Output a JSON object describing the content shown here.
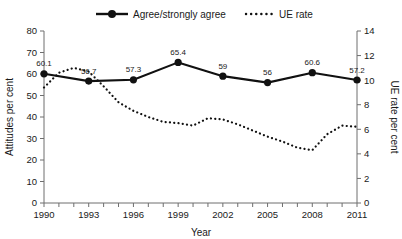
{
  "chart_data": {
    "type": "line",
    "title": "",
    "xlabel": "Year",
    "ylabel": "Attitudes per cent",
    "y2label": "UE rate per cent",
    "grid": false,
    "legend_position": "top",
    "xlim": [
      1990,
      2011
    ],
    "ylim": [
      0,
      80
    ],
    "y2lim": [
      0,
      14
    ],
    "ytick_labels": [
      "0",
      "10",
      "20",
      "30",
      "40",
      "50",
      "60",
      "70",
      "80"
    ],
    "yticks": [
      0,
      10,
      20,
      30,
      40,
      50,
      60,
      70,
      80
    ],
    "y2tick_labels": [
      "0",
      "2",
      "4",
      "6",
      "8",
      "10",
      "12",
      "14"
    ],
    "y2ticks": [
      0,
      2,
      4,
      6,
      8,
      10,
      12,
      14
    ],
    "xtick_labels": [
      "1990",
      "1993",
      "1996",
      "1999",
      "2002",
      "2005",
      "2008",
      "2011"
    ],
    "xticks": [
      1990,
      1993,
      1996,
      1999,
      2002,
      2005,
      2008,
      2011
    ],
    "x_minor_ticks": [
      1990,
      1991,
      1992,
      1993,
      1994,
      1995,
      1996,
      1997,
      1998,
      1999,
      2000,
      2001,
      2002,
      2003,
      2004,
      2005,
      2006,
      2007,
      2008,
      2009,
      2010,
      2011
    ],
    "series": [
      {
        "name": "Agree/strongly agree",
        "axis": "left",
        "style": "solid-marker",
        "x": [
          1990,
          1993,
          1996,
          1999,
          2002,
          2005,
          2008,
          2011
        ],
        "values": [
          60.1,
          56.7,
          57.3,
          65.4,
          59,
          56,
          60.6,
          57.2
        ],
        "point_labels": [
          "60.1",
          "56.7",
          "57.3",
          "65.4",
          "59",
          "56",
          "60.6",
          "57.2"
        ]
      },
      {
        "name": "UE rate",
        "axis": "right",
        "style": "dotted",
        "x": [
          1990,
          1991,
          1992,
          1993,
          1994,
          1995,
          1996,
          1997,
          1998,
          1999,
          2000,
          2001,
          2002,
          2003,
          2004,
          2005,
          2006,
          2007,
          2008,
          2009,
          2010,
          2011
        ],
        "values": [
          9.4,
          10.6,
          11.0,
          10.7,
          9.5,
          8.2,
          7.5,
          7.0,
          6.6,
          6.5,
          6.3,
          6.9,
          6.8,
          6.4,
          5.9,
          5.4,
          5.0,
          4.5,
          4.3,
          5.6,
          6.3,
          6.2
        ]
      }
    ]
  },
  "legend": {
    "items": [
      {
        "label": "Agree/strongly agree",
        "style": "solid-marker"
      },
      {
        "label": "UE rate",
        "style": "dotted"
      }
    ]
  },
  "axes": {
    "left_title": "Attitudes per cent",
    "right_title": "UE rate per cent",
    "x_title": "Year"
  },
  "colors": {
    "series": "#111111",
    "axis": "#6e6e6e",
    "background": "#ffffff"
  }
}
